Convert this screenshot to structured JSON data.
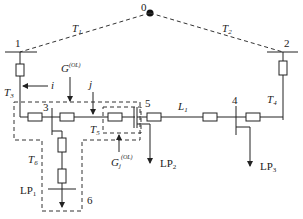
{
  "diagram": {
    "nodes": {
      "n0": "0",
      "n1": "1",
      "n2": "2",
      "n3": "3",
      "n4": "4",
      "n5": "5",
      "n6": "6"
    },
    "branches": {
      "T1": "T",
      "T1_sub": "1",
      "T2": "T",
      "T2_sub": "2",
      "T3": "T",
      "T3_sub": "3",
      "T4": "T",
      "T4_sub": "4",
      "T5": "T",
      "T5_sub": "5",
      "T6": "T",
      "T6_sub": "6",
      "L1": "L",
      "L1_sub": "1"
    },
    "loads": {
      "LP1": "LP",
      "LP1_sub": "1",
      "LP2": "LP",
      "LP2_sub": "2",
      "LP3": "LP",
      "LP3_sub": "3"
    },
    "groups": {
      "G_i": "G",
      "G_i_sup": "(OL)",
      "G_i_sub": "i",
      "G_j": "G",
      "G_j_sup": "(OL)",
      "G_j_sub": "j"
    },
    "markers": {
      "i": "i",
      "j": "j"
    }
  }
}
